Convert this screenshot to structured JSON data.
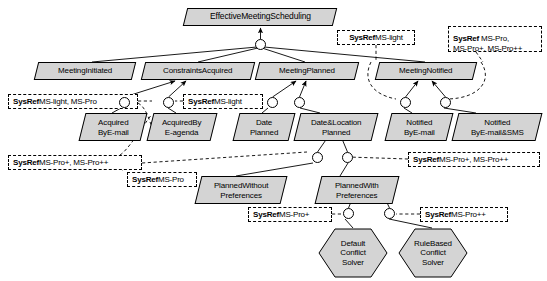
{
  "diagram": {
    "type": "goal-model",
    "colors": {
      "node_fill": "#d4d4d4",
      "node_stroke": "#000000",
      "annotation_fill": "#ffffff",
      "annotation_stroke": "#000000",
      "background": "#ffffff"
    },
    "goals": [
      {
        "id": "root",
        "label": "EffectiveMeetingScheduling",
        "x": 185,
        "y": 8,
        "w": 150,
        "h": 18
      },
      {
        "id": "g_init",
        "label": "MeetingInitiated",
        "x": 36,
        "y": 62,
        "w": 98,
        "h": 18
      },
      {
        "id": "g_constr",
        "label": "ConstraintsAcquired",
        "x": 143,
        "y": 62,
        "w": 110,
        "h": 18
      },
      {
        "id": "g_planned",
        "label": "MeetingPlanned",
        "x": 257,
        "y": 62,
        "w": 100,
        "h": 18
      },
      {
        "id": "g_notified",
        "label": "MeetingNotified",
        "x": 377,
        "y": 62,
        "w": 98,
        "h": 18
      },
      {
        "id": "g_acq_mail",
        "label": "Acquired\nByE-mail",
        "x": 82,
        "y": 113,
        "w": 62,
        "h": 28
      },
      {
        "id": "g_acq_agen",
        "label": "AcquiredBy\nE-agenda",
        "x": 150,
        "y": 113,
        "w": 64,
        "h": 28
      },
      {
        "id": "g_date",
        "label": "Date\nPlanned",
        "x": 236,
        "y": 113,
        "w": 56,
        "h": 28
      },
      {
        "id": "g_datloc",
        "label": "Date&Location\nPlanned",
        "x": 297,
        "y": 113,
        "w": 78,
        "h": 28
      },
      {
        "id": "g_not_mail",
        "label": "Notified\nByE-mail",
        "x": 388,
        "y": 113,
        "w": 62,
        "h": 28
      },
      {
        "id": "g_not_sms",
        "label": "Notified\nByE-mail&SMS",
        "x": 455,
        "y": 113,
        "w": 84,
        "h": 28
      },
      {
        "id": "g_plan_wo",
        "label": "PlannedWithout\nPreferences",
        "x": 198,
        "y": 176,
        "w": 86,
        "h": 28
      },
      {
        "id": "g_plan_w",
        "label": "PlannedWith\nPreferences",
        "x": 318,
        "y": 176,
        "w": 78,
        "h": 28
      }
    ],
    "tasks": [
      {
        "id": "t_default",
        "label": "Default\nConflict\nSolver",
        "x": 318,
        "y": 228,
        "w": 70,
        "h": 50
      },
      {
        "id": "t_rule",
        "label": "RuleBased\nConflict\nSolver",
        "x": 398,
        "y": 228,
        "w": 70,
        "h": 50
      }
    ],
    "annotations": [
      {
        "id": "a1",
        "key": "SysRef",
        "value": "MS-light, MS-Pro",
        "sep": " ",
        "x": 8,
        "y": 94,
        "w": 130,
        "h": 15
      },
      {
        "id": "a2",
        "key": "SysRef",
        "value": "MS-light",
        "sep": " ",
        "x": 183,
        "y": 94,
        "w": 80,
        "h": 15
      },
      {
        "id": "a3",
        "key": "SysRef",
        "value": "MS-light",
        "sep": "",
        "x": 337,
        "y": 30,
        "w": 78,
        "h": 15
      },
      {
        "id": "a4",
        "key": "SysRef",
        "value": "MS-Pro,\nMS-Pro+, MS-Pro++",
        "sep": " ",
        "x": 448,
        "y": 26,
        "w": 94,
        "h": 26
      },
      {
        "id": "a5",
        "key": "SysRef",
        "value": "MS-Pro+, MS-Pro++",
        "sep": " ",
        "x": 8,
        "y": 155,
        "w": 134,
        "h": 15
      },
      {
        "id": "a6",
        "key": "SysRef",
        "value": "MS-Pro",
        "sep": " ",
        "x": 127,
        "y": 172,
        "w": 70,
        "h": 15
      },
      {
        "id": "a7",
        "key": "SysRef",
        "value": "MS-Pro+, MS-Pro++",
        "sep": " ",
        "x": 408,
        "y": 152,
        "w": 132,
        "h": 15
      },
      {
        "id": "a8",
        "key": "SysRef",
        "value": "MS-Pro+",
        "sep": " ",
        "x": 248,
        "y": 207,
        "w": 84,
        "h": 15
      },
      {
        "id": "a9",
        "key": "SysRef",
        "value": "MS-Pro++",
        "sep": " ",
        "x": 420,
        "y": 207,
        "w": 88,
        "h": 15
      }
    ],
    "decomposition_nodes": [
      {
        "id": "d_root",
        "x": 255,
        "y": 39
      },
      {
        "id": "d_constr1",
        "x": 119,
        "y": 97
      },
      {
        "id": "d_constr2",
        "x": 163,
        "y": 97
      },
      {
        "id": "d_plan1",
        "x": 267,
        "y": 97
      },
      {
        "id": "d_plan2",
        "x": 294,
        "y": 97
      },
      {
        "id": "d_not1",
        "x": 400,
        "y": 97
      },
      {
        "id": "d_not2",
        "x": 440,
        "y": 97
      },
      {
        "id": "d_dl1",
        "x": 312,
        "y": 152
      },
      {
        "id": "d_dl2",
        "x": 342,
        "y": 152
      },
      {
        "id": "d_pw1",
        "x": 343,
        "y": 208
      },
      {
        "id": "d_pw2",
        "x": 384,
        "y": 208
      }
    ],
    "edge_legend": {
      "solid": "AND/OR decomposition link",
      "dashed": "system reference annotation link"
    }
  }
}
